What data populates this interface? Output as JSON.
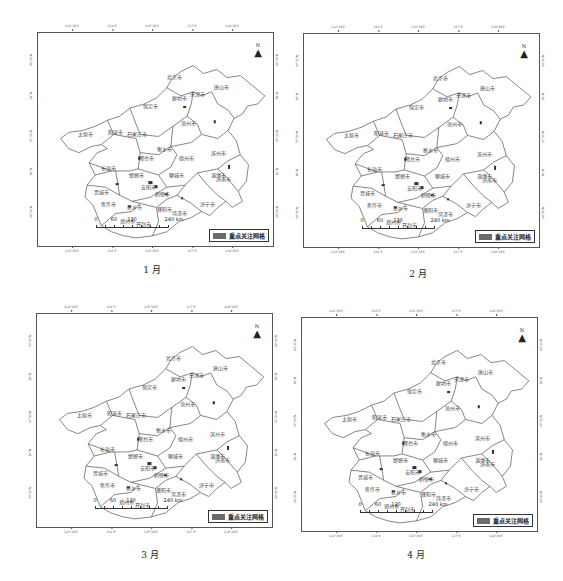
{
  "figure": {
    "panels": [
      {
        "id": "jan",
        "caption": "1 月",
        "legend_label": "重点关注网格",
        "north_label": "N",
        "scale": {
          "ticks": [
            "0",
            "60",
            "120",
            "240 km"
          ]
        },
        "lon_ticks": [
          "112°30'E",
          "114°E",
          "115°30'E",
          "117°E",
          "118°30'E"
        ],
        "lat_ticks": [
          "40°30'N",
          "39°N",
          "37°30'N",
          "36°N",
          "34°30'N"
        ],
        "cities": [
          "北京市",
          "唐山市",
          "天津市",
          "廊坊市",
          "保定市",
          "太原市",
          "阳泉市",
          "石家庄市",
          "沧州市",
          "衡水市",
          "邢台市",
          "德州市",
          "滨州市",
          "长治市",
          "邯郸市",
          "聊城市",
          "淄博市",
          "晋城市",
          "安阳市",
          "鹤壁市",
          "新乡市",
          "焦作市",
          "濮阳市",
          "菏泽市",
          "济宁市",
          "郑州市",
          "开封市",
          "济南市"
        ]
      },
      {
        "id": "feb",
        "caption": "2 月",
        "legend_label": "重点关注网格",
        "north_label": "N",
        "scale": {
          "ticks": [
            "0",
            "60",
            "120",
            "240 km"
          ]
        },
        "lon_ticks": [
          "112°30'E",
          "114°E",
          "115°30'E",
          "117°E",
          "118°30'E"
        ],
        "lat_ticks": [
          "40°30'N",
          "39°N",
          "37°30'N",
          "36°N",
          "34°30'N"
        ],
        "cities": [
          "北京市",
          "唐山市",
          "天津市",
          "廊坊市",
          "保定市",
          "太原市",
          "阳泉市",
          "石家庄市",
          "沧州市",
          "衡水市",
          "邢台市",
          "德州市",
          "滨州市",
          "长治市",
          "邯郸市",
          "聊城市",
          "淄博市",
          "晋城市",
          "安阳市",
          "鹤壁市",
          "新乡市",
          "焦作市",
          "濮阳市",
          "菏泽市",
          "济宁市",
          "郑州市",
          "开封市",
          "济南市"
        ]
      },
      {
        "id": "mar",
        "caption": "3 月",
        "legend_label": "重点关注网格",
        "north_label": "N",
        "scale": {
          "ticks": [
            "0",
            "60",
            "120",
            "240 km"
          ]
        },
        "lon_ticks": [
          "112°30'E",
          "114°E",
          "115°30'E",
          "117°E",
          "118°30'E"
        ],
        "lat_ticks": [
          "40°30'N",
          "39°N",
          "37°30'N",
          "36°N",
          "34°30'N"
        ],
        "cities": [
          "北京市",
          "唐山市",
          "天津市",
          "廊坊市",
          "保定市",
          "太原市",
          "阳泉市",
          "石家庄市",
          "沧州市",
          "衡水市",
          "邢台市",
          "德州市",
          "滨州市",
          "长治市",
          "邯郸市",
          "聊城市",
          "淄博市",
          "晋城市",
          "安阳市",
          "鹤壁市",
          "新乡市",
          "焦作市",
          "濮阳市",
          "菏泽市",
          "济宁市",
          "郑州市",
          "开封市",
          "济南市"
        ]
      },
      {
        "id": "apr",
        "caption": "4 月",
        "legend_label": "重点关注网格",
        "north_label": "N",
        "scale": {
          "ticks": [
            "0",
            "60",
            "120",
            "240 km"
          ]
        },
        "lon_ticks": [
          "112°30'E",
          "114°E",
          "115°30'E",
          "117°E",
          "118°30'E"
        ],
        "lat_ticks": [
          "40°30'N",
          "39°N",
          "37°30'N",
          "36°N",
          "34°30'N"
        ],
        "cities": [
          "北京市",
          "唐山市",
          "天津市",
          "廊坊市",
          "保定市",
          "太原市",
          "阳泉市",
          "石家庄市",
          "沧州市",
          "衡水市",
          "邢台市",
          "德州市",
          "滨州市",
          "长治市",
          "邯郸市",
          "聊城市",
          "淄博市",
          "晋城市",
          "安阳市",
          "鹤壁市",
          "新乡市",
          "焦作市",
          "濮阳市",
          "菏泽市",
          "济宁市",
          "郑州市",
          "开封市",
          "济南市"
        ]
      }
    ]
  }
}
